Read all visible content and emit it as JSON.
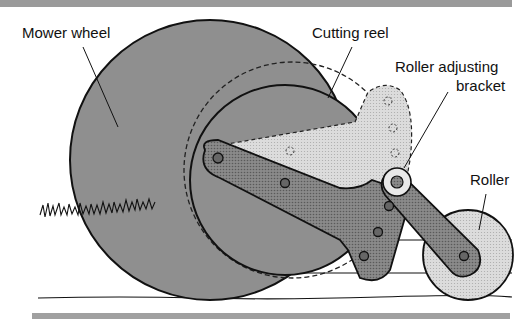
{
  "diagram": {
    "labels": {
      "mower_wheel": "Mower wheel",
      "cutting_reel": "Cutting reel",
      "roller_bracket_line1": "Roller adjusting",
      "roller_bracket_line2": "bracket",
      "roller": "Roller"
    },
    "colors": {
      "band": "#9a9a9a",
      "wheel_fill": "#8f8f8f",
      "arm_fill": "#7d7d7d",
      "light_fill": "#d2d2d2",
      "roller_fill": "#dedede",
      "outline": "#111111"
    }
  }
}
